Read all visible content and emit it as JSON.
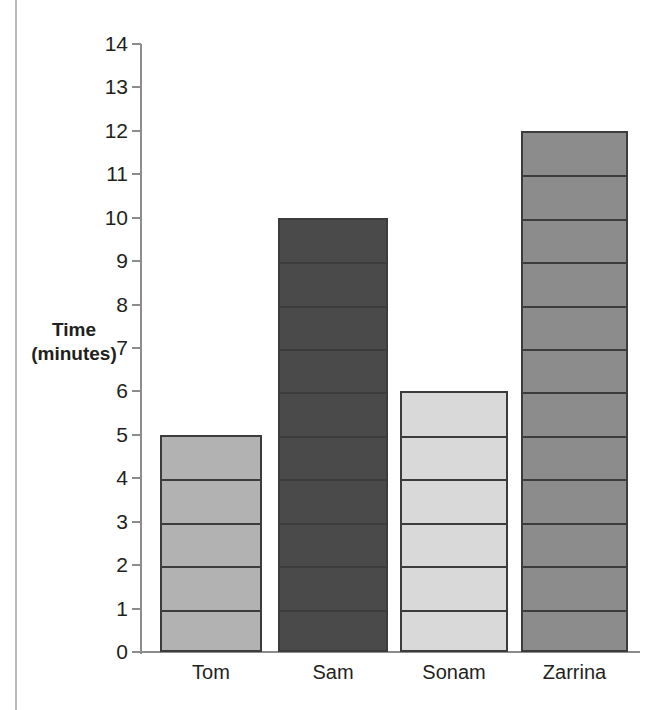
{
  "chart_data": {
    "type": "bar",
    "title": "",
    "subtitle": "",
    "xlabel": "",
    "ylabel": "Time\n(minutes)",
    "ylabel_line1": "Time",
    "ylabel_line2": "(minutes)",
    "categories": [
      "Tom",
      "Sam",
      "Sonam",
      "Zarrina"
    ],
    "values": [
      5,
      10,
      6,
      12
    ],
    "ylim": [
      0,
      14
    ],
    "ytick_step": 1,
    "yticks": [
      0,
      1,
      2,
      3,
      4,
      5,
      6,
      7,
      8,
      9,
      10,
      11,
      12,
      13,
      14
    ],
    "ytick_labels": [
      "0",
      "1",
      "2",
      "3",
      "4",
      "5",
      "6",
      "7",
      "8",
      "9",
      "10",
      "11",
      "12",
      "13",
      "14"
    ],
    "grid": false,
    "legend": false,
    "legend_position": "none",
    "bar_segments": "each bar divided by horizontal rules at every whole unit",
    "bar_colors": [
      "#b2b2b2",
      "#4a4a4a",
      "#d9d9d9",
      "#8c8c8c"
    ],
    "bar_outline_color": "#3c3c3c",
    "axis_color": "#8c8c8c",
    "text_color": "#231f20",
    "background": "#ffffff"
  },
  "bars": [
    {
      "label": "Tom",
      "value": 5,
      "color": "#b2b2b2"
    },
    {
      "label": "Sam",
      "value": 10,
      "color": "#4a4a4a"
    },
    {
      "label": "Sonam",
      "value": 6,
      "color": "#d9d9d9"
    },
    {
      "label": "Zarrina",
      "value": 12,
      "color": "#8c8c8c"
    }
  ]
}
